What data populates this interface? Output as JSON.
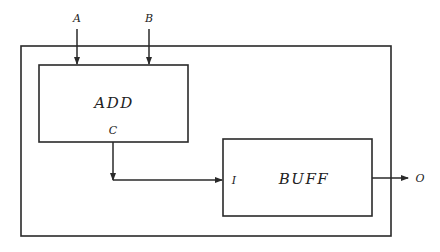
{
  "diagram": {
    "type": "block-diagram",
    "colors": {
      "line": "#2a2a2a",
      "text": "#222222",
      "background": "#ffffff"
    },
    "inputs": [
      {
        "id": "A",
        "label": "A"
      },
      {
        "id": "B",
        "label": "B"
      }
    ],
    "outputs": [
      {
        "id": "O",
        "label": "O"
      }
    ],
    "blocks": [
      {
        "id": "add",
        "label": "ADD",
        "ports": {
          "out": "C"
        }
      },
      {
        "id": "buff",
        "label": "BUFF",
        "ports": {
          "in": "I"
        }
      }
    ],
    "connections": [
      {
        "from": "A",
        "to": "add"
      },
      {
        "from": "B",
        "to": "add"
      },
      {
        "from": "add.C",
        "to": "buff.I"
      },
      {
        "from": "buff",
        "to": "O"
      }
    ]
  }
}
